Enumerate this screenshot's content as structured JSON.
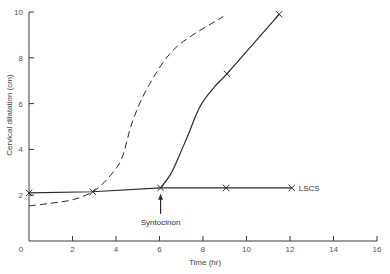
{
  "chart_data": {
    "type": "line",
    "title": "",
    "xlabel": "Time (hr)",
    "ylabel": "Cervical dilatation (cm)",
    "xlim": [
      0,
      16
    ],
    "ylim": [
      0,
      10
    ],
    "xticks": [
      0,
      2,
      4,
      6,
      8,
      10,
      12,
      14,
      16
    ],
    "yticks": [
      2,
      4,
      6,
      8,
      10
    ],
    "grid": false,
    "legend": "none",
    "series": [
      {
        "name": "dashed-curve",
        "style": "dashed",
        "markers": [],
        "points": [
          [
            0,
            1.53
          ],
          [
            1,
            1.65
          ],
          [
            2,
            1.8
          ],
          [
            2.93,
            2.15
          ],
          [
            3.64,
            2.75
          ],
          [
            4.26,
            3.6
          ],
          [
            4.78,
            5.28
          ],
          [
            5.56,
            6.88
          ],
          [
            6.79,
            8.48
          ],
          [
            8.93,
            9.8
          ]
        ]
      },
      {
        "name": "solid-baseline",
        "style": "solid",
        "markers": [
          [
            0,
            2.1
          ],
          [
            2.93,
            2.15
          ],
          [
            6.05,
            2.32
          ],
          [
            9.06,
            2.32
          ],
          [
            12.08,
            2.32
          ]
        ],
        "points": [
          [
            0,
            2.1
          ],
          [
            2.93,
            2.15
          ],
          [
            6.05,
            2.32
          ],
          [
            9.06,
            2.32
          ],
          [
            12.08,
            2.32
          ]
        ]
      },
      {
        "name": "solid-rising",
        "style": "solid",
        "markers": [
          [
            9.1,
            7.3
          ],
          [
            11.5,
            9.9
          ]
        ],
        "points": [
          [
            6.05,
            2.32
          ],
          [
            6.5,
            2.9
          ],
          [
            6.85,
            3.6
          ],
          [
            7.3,
            4.6
          ],
          [
            7.86,
            5.86
          ],
          [
            8.5,
            6.7
          ],
          [
            9.1,
            7.3
          ],
          [
            10.3,
            8.6
          ],
          [
            11.5,
            9.9
          ]
        ]
      }
    ],
    "annotations": [
      {
        "text": "Syntocinon",
        "x": 6.05,
        "y": 2.32,
        "type": "arrow-up-from-below"
      },
      {
        "text": "LSCS",
        "x": 12.08,
        "y": 2.32,
        "type": "label-right"
      }
    ]
  },
  "colors": {
    "line": "#2b2b2b",
    "axis": "#3a3a3a",
    "text": "#555555"
  }
}
